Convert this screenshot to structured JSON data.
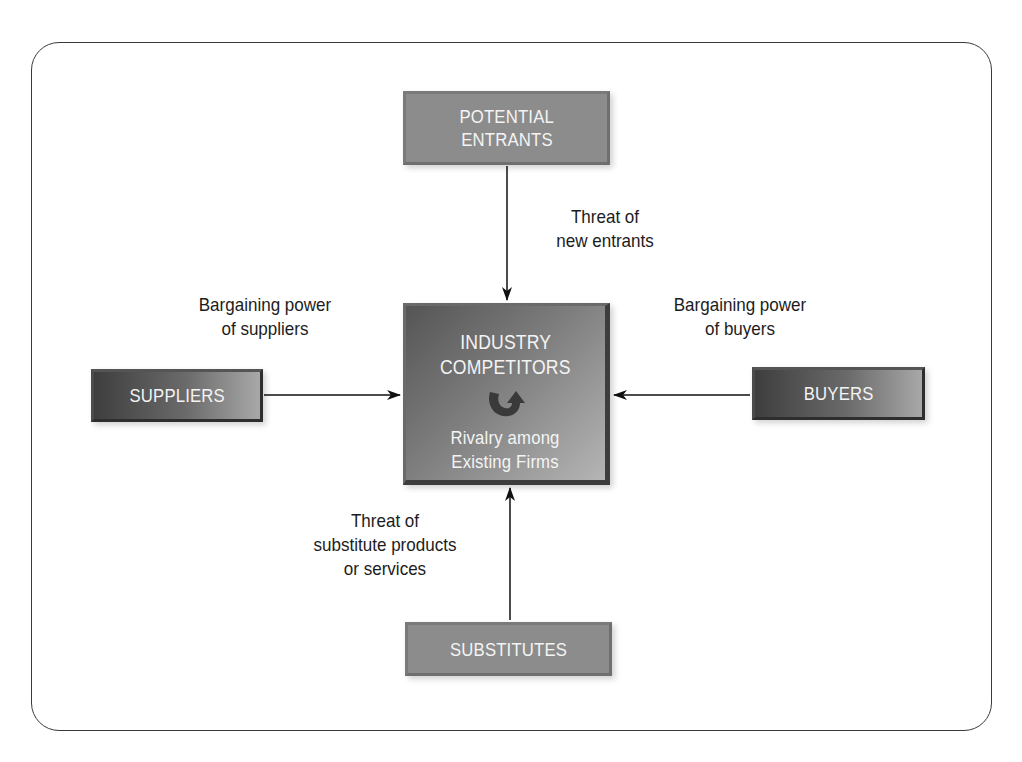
{
  "diagram": {
    "nodes": {
      "potential_entrants": {
        "line1": "POTENTIAL",
        "line2": "ENTRANTS"
      },
      "suppliers": {
        "label": "SUPPLIERS"
      },
      "buyers": {
        "label": "BUYERS"
      },
      "substitutes": {
        "label": "SUBSTITUTES"
      },
      "center": {
        "line1": "INDUSTRY",
        "line2": "COMPETITORS",
        "icon": "rotation-arrow-icon",
        "sub1": "Rivalry among",
        "sub2": "Existing Firms"
      }
    },
    "edges": [
      {
        "from": "potential_entrants",
        "to": "center",
        "label_lines": [
          "Threat of",
          "new entrants"
        ]
      },
      {
        "from": "suppliers",
        "to": "center",
        "label_lines": [
          "Bargaining power",
          "of suppliers"
        ]
      },
      {
        "from": "buyers",
        "to": "center",
        "label_lines": [
          "Bargaining power",
          "of buyers"
        ]
      },
      {
        "from": "substitutes",
        "to": "center",
        "label_lines": [
          "Threat of",
          "substitute products",
          "or services"
        ]
      }
    ]
  }
}
